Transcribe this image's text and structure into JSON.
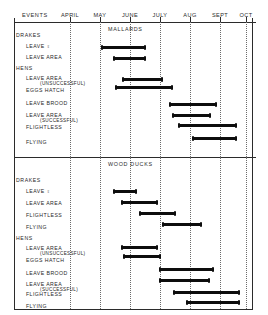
{
  "figure": {
    "events_header": "EVENTS",
    "sections": [
      "MALLARDS",
      "WOOD DUCKS"
    ]
  },
  "chart_data": {
    "type": "bar",
    "title": "",
    "xlabel": "",
    "ylabel": "EVENTS",
    "orientation": "horizontal",
    "grid": true,
    "legend": null,
    "x_axis": {
      "tick_labels": [
        "APRIL",
        "MAY",
        "JUNE",
        "JULY",
        "AUG",
        "SEPT",
        "OCT"
      ],
      "tick_positions_month_index": [
        0,
        1,
        2,
        3,
        4,
        5,
        6
      ],
      "range_months": [
        "APRIL",
        "OCT"
      ]
    },
    "panels": [
      {
        "name": "MALLARDS",
        "groups": [
          {
            "name": "DRAKES",
            "rows": [
              {
                "label": "LEAVE ♀",
                "sublabel": "",
                "start_month": 1.05,
                "end_month": 2.55
              },
              {
                "label": "LEAVE  AREA",
                "sublabel": "",
                "start_month": 1.45,
                "end_month": 2.55
              }
            ]
          },
          {
            "name": "HENS",
            "rows": [
              {
                "label": "LEAVE  AREA",
                "sublabel": "(UNSUCCESSFUL)",
                "start_month": 1.75,
                "end_month": 3.1
              },
              {
                "label": "EGGS  HATCH",
                "sublabel": "",
                "start_month": 1.5,
                "end_month": 3.45
              },
              {
                "label": "LEAVE  BROOD",
                "sublabel": "",
                "start_month": 3.3,
                "end_month": 4.9
              },
              {
                "label": "LEAVE  AREA",
                "sublabel": "(SUCCESSFUL)",
                "start_month": 3.4,
                "end_month": 4.7
              },
              {
                "label": "FLIGHTLESS",
                "sublabel": "",
                "start_month": 3.6,
                "end_month": 5.55
              },
              {
                "label": "FLYING",
                "sublabel": "",
                "start_month": 4.05,
                "end_month": 5.55
              }
            ]
          }
        ]
      },
      {
        "name": "WOOD DUCKS",
        "groups": [
          {
            "name": "DRAKES",
            "rows": [
              {
                "label": "LEAVE ♀",
                "sublabel": "",
                "start_month": 1.4,
                "end_month": 2.2
              },
              {
                "label": "LEAVE  AREA",
                "sublabel": "",
                "start_month": 1.65,
                "end_month": 2.9
              },
              {
                "label": "FLIGHTLESS",
                "sublabel": "",
                "start_month": 2.25,
                "end_month": 3.5
              },
              {
                "label": "FLYING",
                "sublabel": "",
                "start_month": 3.0,
                "end_month": 4.35
              }
            ]
          },
          {
            "name": "HENS",
            "rows": [
              {
                "label": "LEAVE  AREA",
                "sublabel": "(UNSUCCESSFUL)",
                "start_month": 1.7,
                "end_month": 2.9
              },
              {
                "label": "EGGS  HATCH",
                "sublabel": "",
                "start_month": 1.75,
                "end_month": 3.0
              },
              {
                "label": "LEAVE  BROOD",
                "sublabel": "",
                "start_month": 2.95,
                "end_month": 4.75
              },
              {
                "label": "LEAVE  AREA",
                "sublabel": "(SUCCESSFUL)",
                "start_month": 2.95,
                "end_month": 4.65
              },
              {
                "label": "FLIGHTLESS",
                "sublabel": "",
                "start_month": 3.4,
                "end_month": 5.6
              },
              {
                "label": "FLYING",
                "sublabel": "",
                "start_month": 3.85,
                "end_month": 5.6
              }
            ]
          }
        ]
      }
    ]
  },
  "layout": {
    "plot_left_px": 14,
    "plot_right_px": 252,
    "month_x_px": [
      70,
      100,
      130,
      160,
      190,
      220,
      246
    ],
    "colors": {
      "ink": "#0d0d0d",
      "rule": "#2b2b2b",
      "grid": "#6b6b6b",
      "paper": "#fdfdfc"
    }
  },
  "rows_render": {
    "mallards": [
      {
        "key": "drakes-header",
        "type": "group",
        "label": "DRAKES",
        "sub": "",
        "label_x": 16,
        "label_y": 32
      },
      {
        "key": "drakes-leave-female",
        "type": "bar",
        "label": "LEAVE ♀",
        "sub": "",
        "label_x": 26,
        "label_y": 43,
        "bar_y": 46,
        "bar_x1": 101,
        "bar_x2": 146
      },
      {
        "key": "drakes-leave-area",
        "type": "bar",
        "label": "LEAVE  AREA",
        "sub": "",
        "label_x": 26,
        "label_y": 54,
        "bar_y": 57,
        "bar_x1": 113,
        "bar_x2": 146
      },
      {
        "key": "hens-header",
        "type": "group",
        "label": "HENS",
        "sub": "",
        "label_x": 16,
        "label_y": 65
      },
      {
        "key": "hens-leave-area-uns",
        "type": "bar",
        "label": "LEAVE  AREA",
        "sub": "(UNSUCCESSFUL)",
        "label_x": 26,
        "label_y": 75,
        "bar_y": 78,
        "bar_x1": 122,
        "bar_x2": 163
      },
      {
        "key": "hens-eggs-hatch",
        "type": "bar",
        "label": "EGGS  HATCH",
        "sub": "",
        "label_x": 26,
        "label_y": 87,
        "bar_y": 86,
        "bar_x1": 115,
        "bar_x2": 173
      },
      {
        "key": "hens-leave-brood",
        "type": "bar",
        "label": "LEAVE  BROOD",
        "sub": "",
        "label_x": 26,
        "label_y": 100,
        "bar_y": 103,
        "bar_x1": 169,
        "bar_x2": 217
      },
      {
        "key": "hens-leave-area-suc",
        "type": "bar",
        "label": "LEAVE  AREA",
        "sub": "(SUCCESSFUL)",
        "label_x": 26,
        "label_y": 112,
        "bar_y": 114,
        "bar_x1": 172,
        "bar_x2": 211
      },
      {
        "key": "hens-flightless",
        "type": "bar",
        "label": "FLIGHTLESS",
        "sub": "",
        "label_x": 26,
        "label_y": 124,
        "bar_y": 124,
        "bar_x1": 178,
        "bar_x2": 237
      },
      {
        "key": "hens-flying",
        "type": "bar",
        "label": "FLYING",
        "sub": "",
        "label_x": 26,
        "label_y": 139,
        "bar_y": 137,
        "bar_x1": 192,
        "bar_x2": 237
      }
    ],
    "woodducks": [
      {
        "key": "wd-drakes-header",
        "type": "group",
        "label": "DRAKES",
        "sub": "",
        "label_x": 16,
        "label_y": 177
      },
      {
        "key": "wd-drakes-leave-female",
        "type": "bar",
        "label": "LEAVE ♀",
        "sub": "",
        "label_x": 26,
        "label_y": 188,
        "bar_y": 190,
        "bar_x1": 113,
        "bar_x2": 137
      },
      {
        "key": "wd-drakes-leave-area",
        "type": "bar",
        "label": "LEAVE  AREA",
        "sub": "",
        "label_x": 26,
        "label_y": 200,
        "bar_y": 201,
        "bar_x1": 121,
        "bar_x2": 158
      },
      {
        "key": "wd-drakes-flightless",
        "type": "bar",
        "label": "FLIGHTLESS",
        "sub": "",
        "label_x": 26,
        "label_y": 212,
        "bar_y": 212,
        "bar_x1": 139,
        "bar_x2": 176
      },
      {
        "key": "wd-drakes-flying",
        "type": "bar",
        "label": "FLYING",
        "sub": "",
        "label_x": 26,
        "label_y": 224,
        "bar_y": 223,
        "bar_x1": 162,
        "bar_x2": 202
      },
      {
        "key": "wd-hens-header",
        "type": "group",
        "label": "HENS",
        "sub": "",
        "label_x": 16,
        "label_y": 235
      },
      {
        "key": "wd-hens-leave-area-uns",
        "type": "bar",
        "label": "LEAVE  AREA",
        "sub": "(UNSUCCESSFUL)",
        "label_x": 26,
        "label_y": 245,
        "bar_y": 246,
        "bar_x1": 121,
        "bar_x2": 158
      },
      {
        "key": "wd-hens-eggs-hatch",
        "type": "bar",
        "label": "EGGS  HATCH",
        "sub": "",
        "label_x": 26,
        "label_y": 257,
        "bar_y": 255,
        "bar_x1": 123,
        "bar_x2": 161
      },
      {
        "key": "wd-hens-leave-brood",
        "type": "bar",
        "label": "LEAVE  BROOD",
        "sub": "",
        "label_x": 26,
        "label_y": 270,
        "bar_y": 268,
        "bar_x1": 159,
        "bar_x2": 214
      },
      {
        "key": "wd-hens-leave-area-suc",
        "type": "bar",
        "label": "LEAVE  AREA",
        "sub": "(SUCCESSFUL)",
        "label_x": 26,
        "label_y": 281,
        "bar_y": 279,
        "bar_x1": 159,
        "bar_x2": 210
      },
      {
        "key": "wd-hens-flightless",
        "type": "bar",
        "label": "FLIGHTLESS",
        "sub": "",
        "label_x": 26,
        "label_y": 291,
        "bar_y": 291,
        "bar_x1": 173,
        "bar_x2": 240
      },
      {
        "key": "wd-hens-flying",
        "type": "bar",
        "label": "FLYING",
        "sub": "",
        "label_x": 26,
        "label_y": 303,
        "bar_y": 301,
        "bar_x1": 186,
        "bar_x2": 240
      }
    ]
  },
  "section_titles": [
    {
      "key": "mallards",
      "label": "MALLARDS",
      "x": 108,
      "y": 26
    },
    {
      "key": "woodducks",
      "label": "WOOD DUCKS",
      "x": 108,
      "y": 161
    }
  ],
  "month_labels": [
    {
      "label": "APRIL",
      "x": 70
    },
    {
      "label": "MAY",
      "x": 100
    },
    {
      "label": "JUNE",
      "x": 130
    },
    {
      "label": "JULY",
      "x": 160
    },
    {
      "label": "AUG",
      "x": 190
    },
    {
      "label": "SEPT",
      "x": 220
    },
    {
      "label": "OCT",
      "x": 246
    }
  ]
}
